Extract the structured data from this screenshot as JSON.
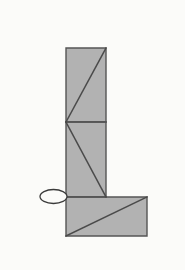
{
  "canvas": {
    "width": 185,
    "height": 270,
    "background_color": "#fbfbf9"
  },
  "style": {
    "fill_color": "#b2b2b2",
    "stroke_color": "#555555",
    "diagonal_stroke_color": "#4a4a4a",
    "ellipse_fill": "#fbfbf9",
    "ellipse_stroke": "#3a3a3a",
    "stroke_width": 1.4,
    "diagonal_width": 1.5,
    "ellipse_stroke_width": 1.3
  },
  "figure": {
    "shapes": [
      {
        "name": "upper-vertical-panel",
        "type": "rectangle",
        "points": "66,48 106,48 106,122 66,122"
      },
      {
        "name": "middle-vertical-panel",
        "type": "rectangle",
        "points": "66,122 106,122 106,197 66,197"
      },
      {
        "name": "bottom-horizontal-panel",
        "type": "rectangle",
        "points": "66,197 147,197 147,236 66,236"
      }
    ],
    "diagonals": [
      {
        "name": "upper-panel-diagonal",
        "x1": 66,
        "y1": 122,
        "x2": 106,
        "y2": 48
      },
      {
        "name": "middle-panel-diagonal",
        "x1": 66,
        "y1": 122,
        "x2": 106,
        "y2": 197
      },
      {
        "name": "bottom-panel-diagonal",
        "x1": 66,
        "y1": 236,
        "x2": 147,
        "y2": 197
      }
    ],
    "dividers": [
      {
        "name": "upper-middle-divider",
        "x1": 66,
        "y1": 122,
        "x2": 106,
        "y2": 122
      },
      {
        "name": "middle-bottom-divider",
        "x1": 66,
        "y1": 197,
        "x2": 106,
        "y2": 197
      }
    ],
    "ellipse": {
      "name": "vertex-marker-ellipse",
      "cx": 53.5,
      "cy": 196.5,
      "rx": 13.5,
      "ry": 7.0
    }
  }
}
